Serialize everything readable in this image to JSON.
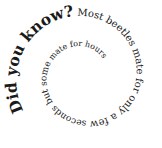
{
  "spiral_text": {
    "full": "Did you know? Most beetles mate for only a few seconds but some mate for hours",
    "segments": [
      {
        "text": "Did you know?",
        "size": 15.5,
        "weight": "bold"
      },
      {
        "text": " Most beetles mate for only a few",
        "size": 10,
        "weight": "normal"
      },
      {
        "text": " seconds but some",
        "size": 9,
        "weight": "normal"
      },
      {
        "text": " mate for hours",
        "size": 8,
        "weight": "normal"
      }
    ]
  },
  "spiral": {
    "center_x": 84,
    "center_y": 76,
    "start_angle_deg": 150,
    "start_radius": 70,
    "end_radius": 8,
    "turns": 2.05
  },
  "colors": {
    "text": "#1a1a1a",
    "background": "#ffffff"
  }
}
